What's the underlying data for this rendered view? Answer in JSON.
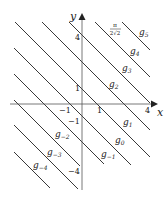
{
  "diagram": {
    "axes": {
      "x_label": "x",
      "y_label": "y",
      "x_ticks": [
        {
          "v": -1,
          "t": "−1"
        },
        {
          "v": 1,
          "t": "1"
        },
        {
          "v": 4,
          "t": "4"
        }
      ],
      "y_ticks": [
        {
          "v": 4,
          "t": "4"
        },
        {
          "v": 1,
          "t": "1"
        },
        {
          "v": -1,
          "t": "−1"
        },
        {
          "v": -4,
          "t": "−4"
        }
      ]
    },
    "annotation": "π/(2√2)",
    "annotation_num": "π",
    "annotation_den": "2√2",
    "lines": [
      {
        "name": "g5",
        "sub": "5"
      },
      {
        "name": "g4",
        "sub": "4"
      },
      {
        "name": "g3",
        "sub": "3"
      },
      {
        "name": "g2",
        "sub": "2"
      },
      {
        "name": "g1",
        "sub": "1"
      },
      {
        "name": "g0",
        "sub": "0"
      },
      {
        "name": "g-1",
        "sub": "−1"
      },
      {
        "name": "g-2",
        "sub": "−2"
      },
      {
        "name": "g-3",
        "sub": "−3"
      },
      {
        "name": "g-4",
        "sub": "−4"
      }
    ],
    "line_color": "#222222",
    "axis_color": "#555555"
  }
}
